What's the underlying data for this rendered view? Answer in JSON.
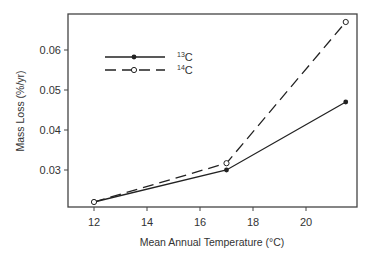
{
  "chart_data": {
    "type": "line",
    "title": "",
    "xlabel": "Mean Annual Temperature (°C)",
    "ylabel": "Mass Loss (%/yr)",
    "x": [
      12,
      17,
      21.5
    ],
    "series": [
      {
        "name": "13C",
        "label_sup": "13",
        "label_base": "C",
        "values": [
          0.022,
          0.03,
          0.047
        ],
        "line": "solid",
        "marker": "filled-circle",
        "color": "#222222"
      },
      {
        "name": "14C",
        "label_sup": "14",
        "label_base": "C",
        "values": [
          0.022,
          0.0317,
          0.067
        ],
        "line": "dashed",
        "marker": "open-circle",
        "color": "#222222"
      }
    ],
    "xticks": [
      12,
      14,
      16,
      18,
      20
    ],
    "xtick_labels": [
      "12",
      "14",
      "16",
      "18",
      "20"
    ],
    "yticks": [
      0.03,
      0.04,
      0.05,
      0.06
    ],
    "ytick_labels": [
      "0.03",
      "0.04",
      "0.05",
      "0.06"
    ],
    "xlim": [
      11,
      22.3
    ],
    "ylim": [
      0.0208,
      0.0713
    ],
    "grid": false,
    "legend_position": "upper-left"
  }
}
